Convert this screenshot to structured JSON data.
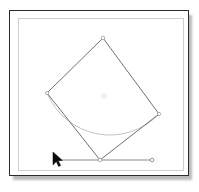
{
  "window": {
    "title": "",
    "background_color": "#ffffff",
    "frame_color": "#2b2b2b",
    "inner_border_color": "#cfcfcf",
    "shadow_color": "#b9b9b9"
  },
  "canvas": {
    "name": "geometry-canvas",
    "width": 199,
    "height": 192
  },
  "colors": {
    "square_stroke": "#6e6e78",
    "arc_stroke": "#c2c2c6",
    "line_stroke": "#8a8a92",
    "point_fill": "#ffffff",
    "point_stroke": "#9a9aa2",
    "cursor_fill": "#000000",
    "center_mark": "#d8d8dc"
  },
  "chart_data": {
    "type": "diagram",
    "title": "",
    "shapes": [
      {
        "name": "rotated-square",
        "type": "polygon",
        "stroke": "#6e6e78",
        "stroke_width": 1,
        "fill": "none",
        "vertices": [
          {
            "label": "top",
            "x": 103,
            "y": 38
          },
          {
            "label": "right",
            "x": 159,
            "y": 114
          },
          {
            "label": "bottom",
            "x": 100,
            "y": 160
          },
          {
            "label": "left",
            "x": 47,
            "y": 93
          }
        ]
      },
      {
        "name": "circular-arc",
        "type": "arc",
        "stroke": "#c2c2c6",
        "stroke_width": 1,
        "fill": "none",
        "path": "M 47 93 A 68 68 0 0 0 159 114",
        "endpoints": [
          {
            "label": "arc-start",
            "x": 47,
            "y": 93
          },
          {
            "label": "arc-end",
            "x": 159,
            "y": 114
          }
        ],
        "radius": 68,
        "sweep": "below"
      },
      {
        "name": "baseline-segment",
        "type": "line",
        "stroke": "#8a8a92",
        "stroke_width": 1,
        "x1": 54,
        "y1": 160,
        "x2": 152,
        "y2": 160
      }
    ],
    "points": [
      {
        "name": "vertex-top-point",
        "x": 103,
        "y": 38,
        "radius": 1.8
      },
      {
        "name": "vertex-right-point",
        "x": 159,
        "y": 114,
        "radius": 1.6
      },
      {
        "name": "vertex-left-point",
        "x": 47,
        "y": 93,
        "radius": 1.6
      },
      {
        "name": "vertex-bottom-point",
        "x": 100,
        "y": 160,
        "radius": 1.8
      },
      {
        "name": "line-right-endpoint",
        "x": 152,
        "y": 160,
        "radius": 1.8
      },
      {
        "name": "center-mark-point",
        "x": 104,
        "y": 96,
        "radius": 1.4
      }
    ],
    "cursor": {
      "name": "mouse-pointer",
      "x": 53,
      "y": 155,
      "shape": "arrow-pointer",
      "fill": "#000000",
      "rotation_deg": 0
    },
    "xlabel": "",
    "ylabel": "",
    "grid": false,
    "legend": null,
    "annotations": []
  }
}
